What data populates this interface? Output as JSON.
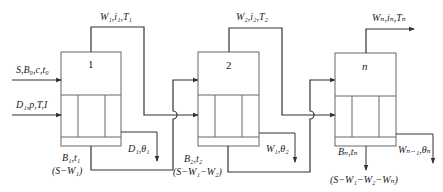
{
  "diagram": {
    "colors": {
      "line": "#333333",
      "box": "#666666",
      "background": "#ffffff"
    },
    "effects": [
      {
        "id": "1",
        "label": "1"
      },
      {
        "id": "2",
        "label": "2"
      },
      {
        "id": "n",
        "label": "n"
      }
    ],
    "labels": {
      "feed": "S,B₀,c,t₀",
      "steam": "D₁,p,T,I",
      "vapor1": "W₁,i₁,T₁",
      "vapor2": "W₂,i₂,T₂",
      "vaporn": "Wₙ,iₙ,Tₙ",
      "product1": "B₁,t₁",
      "product1_flow": "(S−W₁)",
      "condensate1": "D₁,θ₁",
      "product2": "B₂,t₂",
      "product2_flow": "(S−W₁−W₂)",
      "condensate2": "W₁,θ₂",
      "productn": "Bₙ,tₙ",
      "productn_flow": "(S−W₁−W₂−Wₙ)",
      "condensaten": "Wₙ₋₁,θₙ"
    }
  }
}
